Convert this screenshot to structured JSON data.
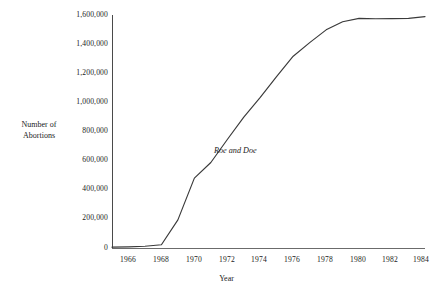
{
  "chart_data": {
    "type": "line",
    "title": "",
    "xlabel": "Year",
    "ylabel": "Number of Abortions",
    "ylabel_lines": [
      "Number of",
      "Abortions"
    ],
    "xlim": [
      1966,
      1985
    ],
    "ylim": [
      0,
      1600000
    ],
    "grid": false,
    "legend": "none",
    "xticks": [
      1966,
      1968,
      1970,
      1972,
      1974,
      1976,
      1978,
      1980,
      1982,
      1984
    ],
    "xtick_labels": [
      "1966",
      "1968",
      "1970",
      "1972",
      "1974",
      "1976",
      "1978",
      "1980",
      "1982",
      "1984"
    ],
    "yticks": [
      0,
      200000,
      400000,
      600000,
      800000,
      1000000,
      1200000,
      1400000,
      1600000
    ],
    "ytick_labels": [
      "0",
      "200,000",
      "400,000",
      "600,000",
      "800,000",
      "1,000,000",
      "1,200,000",
      "1,400,000",
      "1,600,000"
    ],
    "series": [
      {
        "name": "Number of Abortions",
        "color": "#3a3a3a",
        "x": [
          1966,
          1967,
          1968,
          1969,
          1970,
          1971,
          1972,
          1973,
          1974,
          1975,
          1976,
          1977,
          1978,
          1979,
          1980,
          1981,
          1982,
          1983,
          1984,
          1985
        ],
        "values": [
          6000,
          8000,
          12000,
          22000,
          193000,
          480000,
          587000,
          745000,
          899000,
          1034000,
          1179000,
          1317000,
          1410000,
          1498000,
          1554000,
          1577000,
          1574000,
          1575000,
          1577000,
          1589000
        ]
      }
    ],
    "annotations": [
      {
        "text": "Roe and Doe",
        "x": 1973,
        "y": 700000,
        "style": "italic"
      }
    ]
  }
}
